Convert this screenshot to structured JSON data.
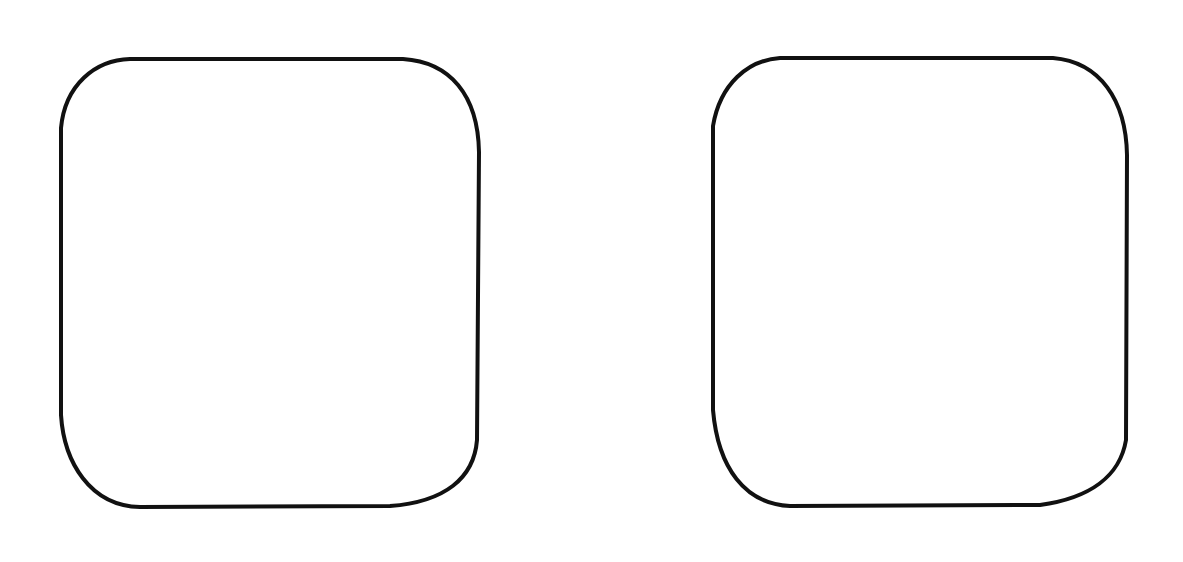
{
  "canvas": {
    "width": 1183,
    "height": 562,
    "background": "#ffffff"
  },
  "shapes": [
    {
      "name": "left-rounded-square",
      "kind": "rounded-rectangle-outline",
      "stroke": "#111111",
      "fill": "#ffffff",
      "bounds": {
        "x": 60,
        "y": 58,
        "width": 420,
        "height": 450
      },
      "path": "M 130 59 L 403 59 C 450 62 478 95 479 152 L 477 440 C 474 478 445 502 390 506 L 140 507 C 90 506 64 462 61 415 L 61 128 C 65 85 95 60 130 59 Z"
    },
    {
      "name": "right-rounded-square",
      "kind": "rounded-rectangle-outline",
      "stroke": "#111111",
      "fill": "#ffffff",
      "bounds": {
        "x": 712,
        "y": 57,
        "width": 416,
        "height": 451
      },
      "path": "M 780 58 L 1053 58 C 1100 62 1126 100 1127 155 L 1126 440 C 1120 476 1090 498 1040 505 L 790 506 C 745 504 718 468 713 410 L 713 126 C 720 84 748 60 780 58 Z"
    }
  ]
}
